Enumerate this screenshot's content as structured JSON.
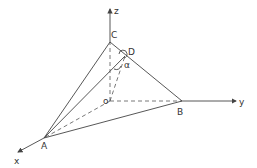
{
  "diagram": {
    "type": "3d-geometry-tetrahedron",
    "axes": {
      "x": "x",
      "y": "y",
      "z": "z"
    },
    "points": {
      "origin": "o",
      "A": "A",
      "B": "B",
      "C": "C",
      "D": "D"
    },
    "angle_label": "α",
    "colors": {
      "stroke": "#444444",
      "background": "#ffffff"
    }
  }
}
